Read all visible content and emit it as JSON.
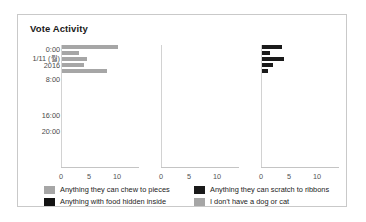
{
  "card": {
    "title": "Vote Activity"
  },
  "chart_data": {
    "type": "bar",
    "orientation": "horizontal",
    "title": "Vote Activity",
    "xlabel": "",
    "ylabel": "",
    "grid": false,
    "legend_position": "bottom",
    "xlim": [
      0,
      13
    ],
    "xticks": [
      0,
      5,
      10
    ],
    "xtick_labels": [
      "0",
      "5",
      "10"
    ],
    "ytick_labels": [
      "0:00",
      "1/11 (월)",
      "2016",
      "8:00",
      "16:00",
      "20:00"
    ],
    "panels": [
      {
        "name": "Anything they can chew to pieces",
        "color": "#a6a6a6",
        "values": [
          10.0,
          3.0,
          4.5,
          4.0,
          8.0
        ]
      },
      {
        "name": "Anything with food hidden inside",
        "color": "#1a1a1a",
        "values": [
          0,
          0,
          0,
          0,
          0
        ]
      },
      {
        "name": "Anything they can scratch to ribbons",
        "color": "#1a1a1a",
        "values": [
          3.5,
          1.5,
          4.0,
          2.0,
          1.0
        ]
      }
    ],
    "series": [
      {
        "name": "Anything they can chew to pieces",
        "color": "#a6a6a6",
        "values": [
          10.0,
          3.0,
          4.5,
          4.0,
          8.0
        ]
      },
      {
        "name": "Anything with food hidden inside",
        "color": "#1a1a1a",
        "values": [
          0,
          0,
          0,
          0,
          0
        ]
      },
      {
        "name": "Anything they can scratch to ribbons",
        "color": "#1a1a1a",
        "values": [
          3.5,
          1.5,
          4.0,
          2.0,
          1.0
        ]
      },
      {
        "name": "I don't have a dog or cat",
        "color": "#a6a6a6",
        "values": [
          0,
          0,
          0,
          0,
          0
        ]
      }
    ]
  },
  "legend": {
    "items": [
      {
        "label": "Anything they can chew to pieces",
        "color": "#a6a6a6"
      },
      {
        "label": "Anything they can scratch to ribbons",
        "color": "#1a1a1a"
      },
      {
        "label": "Anything with food hidden inside",
        "color": "#121212"
      },
      {
        "label": "I don't have a dog or cat",
        "color": "#a6a6a6"
      }
    ]
  }
}
